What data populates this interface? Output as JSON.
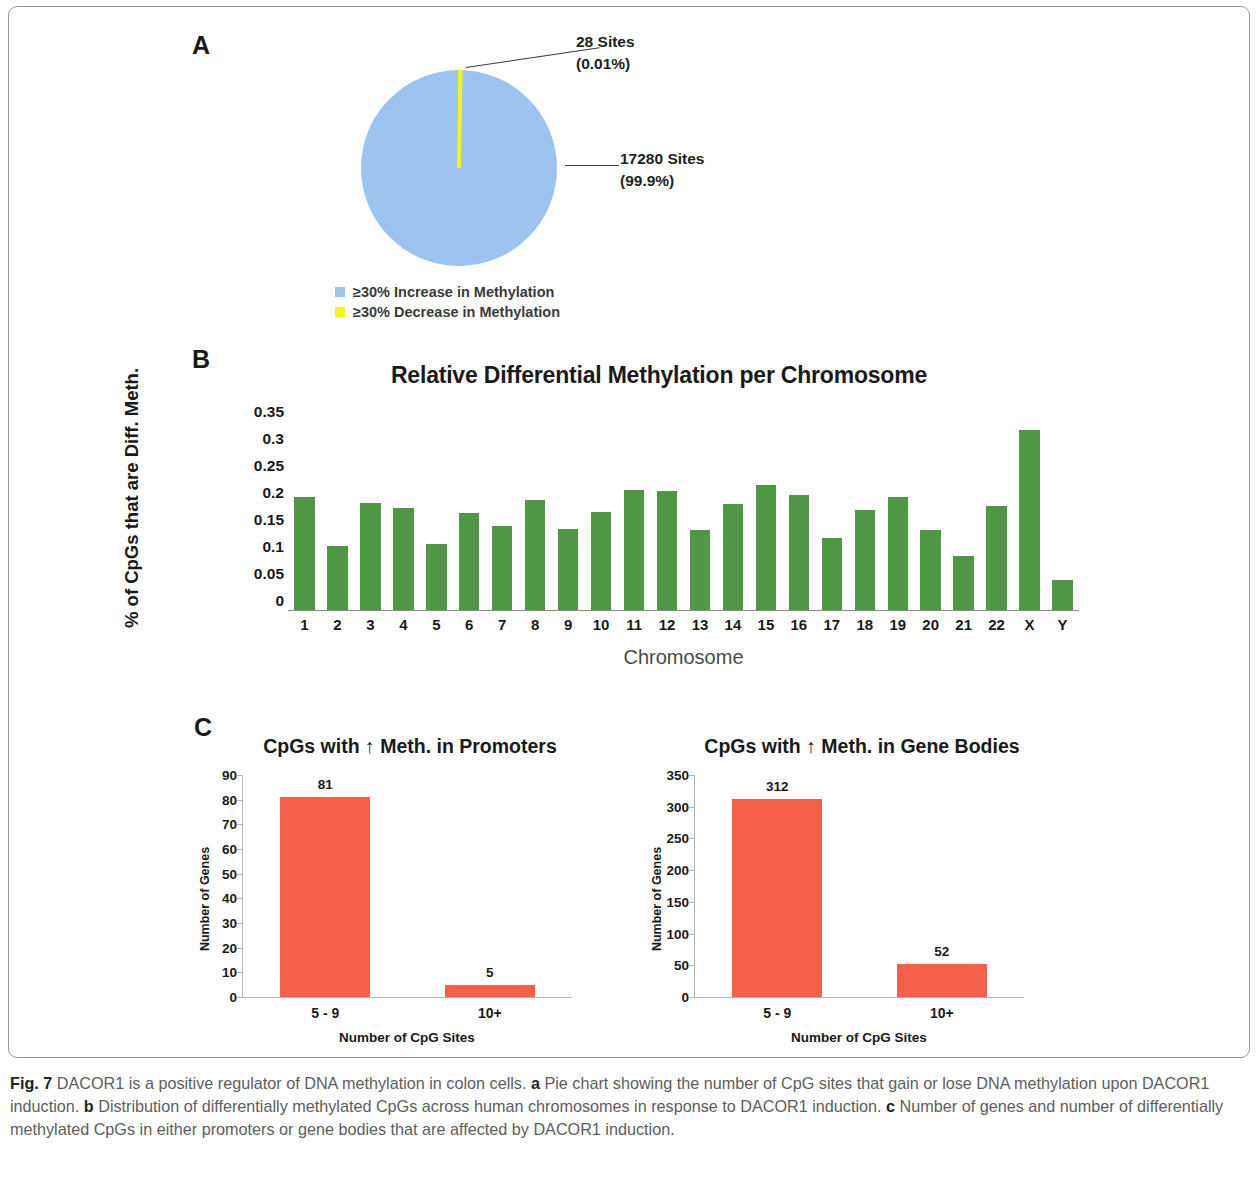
{
  "figure": {
    "caption_prefix": "Fig. 7",
    "caption_text": " DACOR1 is a positive regulator of DNA methylation in colon cells. ",
    "caption_a_tag": "a",
    "caption_a_text": " Pie chart showing the number of CpG sites that gain or lose DNA methylation upon DACOR1 induction. ",
    "caption_b_tag": "b",
    "caption_b_text": " Distribution of differentially methylated CpGs across human chromosomes in response to DACOR1 induction. ",
    "caption_c_tag": "c",
    "caption_c_text": " Number of genes and number of differentially methylated CpGs in either promoters or gene bodies that are affected by DACOR1 induction."
  },
  "panel_a": {
    "letter": "A",
    "callout_yellow_line1": "28 Sites",
    "callout_yellow_line2": "(0.01%)",
    "callout_blue_line1": "17280 Sites",
    "callout_blue_line2": "(99.9%)",
    "legend": [
      {
        "label": "≥30% Increase in Methylation",
        "color": "#9dc3f0"
      },
      {
        "label": "≥30% Decrease in Methylation",
        "color": "#f7f318"
      }
    ]
  },
  "panel_b": {
    "letter": "B",
    "ylabel": "% of CpGs that are Diff. Meth.",
    "xlabel": "Chromosome"
  },
  "panel_c": {
    "letter": "C"
  },
  "chart_data": [
    {
      "id": "pie-methylation",
      "type": "pie",
      "title": "",
      "legend_position": "bottom",
      "slices": [
        {
          "label": "≥30% Increase in Methylation",
          "value": 17280,
          "percent": 99.9,
          "color": "#9dc3f0"
        },
        {
          "label": "≥30% Decrease in Methylation",
          "value": 28,
          "percent": 0.01,
          "color": "#f7f318"
        }
      ]
    },
    {
      "id": "relative-differential-methylation-per-chromosome",
      "type": "bar",
      "title": "Relative Differential Methylation per Chromosome",
      "xlabel": "Chromosome",
      "ylabel": "% of CpGs that are Diff. Meth.",
      "ylim": [
        0,
        0.35
      ],
      "yticks": [
        0,
        0.05,
        0.1,
        0.15,
        0.2,
        0.25,
        0.3,
        0.35
      ],
      "ytick_labels": [
        "0",
        "0.05",
        "0.1",
        "0.15",
        "0.2",
        "0.25",
        "0.3",
        "0.35"
      ],
      "grid": false,
      "bar_color": "#4f9645",
      "categories": [
        "1",
        "2",
        "3",
        "4",
        "5",
        "6",
        "7",
        "8",
        "9",
        "10",
        "11",
        "12",
        "13",
        "14",
        "15",
        "16",
        "17",
        "18",
        "19",
        "20",
        "21",
        "22",
        "X",
        "Y"
      ],
      "values": [
        0.21,
        0.118,
        0.198,
        0.188,
        0.122,
        0.18,
        0.155,
        0.203,
        0.15,
        0.182,
        0.222,
        0.22,
        0.148,
        0.196,
        0.231,
        0.213,
        0.133,
        0.186,
        0.21,
        0.148,
        0.1,
        0.192,
        0.333,
        0.055
      ]
    },
    {
      "id": "cpgs-increased-meth-promoters",
      "type": "bar",
      "title": "CpGs with ↑ Meth. in Promoters",
      "xlabel": "Number of CpG Sites",
      "ylabel": "Number of Genes",
      "ylim": [
        0,
        90
      ],
      "yticks": [
        0,
        10,
        20,
        30,
        40,
        50,
        60,
        70,
        80,
        90
      ],
      "ytick_labels": [
        "0",
        "10",
        "20",
        "30",
        "40",
        "50",
        "60",
        "70",
        "80",
        "90"
      ],
      "grid": false,
      "bar_color": "#f4604a",
      "categories": [
        "5 - 9",
        "10+"
      ],
      "values": [
        81,
        5
      ],
      "data_labels": [
        "81",
        "5"
      ]
    },
    {
      "id": "cpgs-increased-meth-gene-bodies",
      "type": "bar",
      "title": "CpGs with ↑ Meth. in Gene Bodies",
      "xlabel": "Number of CpG Sites",
      "ylabel": "Number of Genes",
      "ylim": [
        0,
        350
      ],
      "yticks": [
        0,
        50,
        100,
        150,
        200,
        250,
        300,
        350
      ],
      "ytick_labels": [
        "0",
        "50",
        "100",
        "150",
        "200",
        "250",
        "300",
        "350"
      ],
      "grid": false,
      "bar_color": "#f4604a",
      "categories": [
        "5 - 9",
        "10+"
      ],
      "values": [
        312,
        52
      ],
      "data_labels": [
        "312",
        "52"
      ]
    }
  ]
}
